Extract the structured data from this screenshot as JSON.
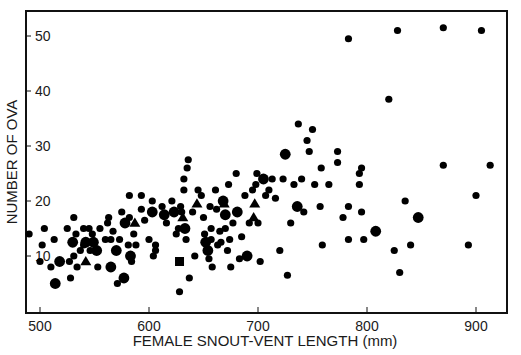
{
  "chart_data": {
    "type": "scatter",
    "title": "",
    "xlabel": "FEMALE SNOUT-VENT LENGTH (mm)",
    "ylabel": "NUMBER OF OVA",
    "xlim": [
      487,
      928
    ],
    "ylim": [
      0,
      56
    ],
    "xticks": [
      500,
      600,
      700,
      800,
      900
    ],
    "yticks": [
      10,
      20,
      30,
      40,
      50
    ],
    "grid": false,
    "legend": null,
    "marker_color": "#000000",
    "marker_shapes": [
      "circle",
      "triangle",
      "square"
    ],
    "marker_sizes_note": "small / medium / large circles denote overlapping records",
    "points": [
      [
        490,
        14,
        "s",
        "c"
      ],
      [
        500,
        9,
        "s",
        "c"
      ],
      [
        502,
        12,
        "s",
        "c"
      ],
      [
        504,
        15,
        "s",
        "c"
      ],
      [
        510,
        8,
        "s",
        "c"
      ],
      [
        513,
        13,
        "s",
        "c"
      ],
      [
        514,
        5,
        "m",
        "c"
      ],
      [
        518,
        9,
        "m",
        "c"
      ],
      [
        525,
        15,
        "s",
        "c"
      ],
      [
        527,
        9,
        "s",
        "c"
      ],
      [
        528,
        6,
        "s",
        "c"
      ],
      [
        530,
        12.5,
        "m",
        "c"
      ],
      [
        531,
        17,
        "s",
        "c"
      ],
      [
        531,
        10,
        "s",
        "c"
      ],
      [
        533,
        14,
        "s",
        "c"
      ],
      [
        534,
        8,
        "s",
        "c"
      ],
      [
        537,
        11,
        "s",
        "c"
      ],
      [
        540,
        15,
        "s",
        "c"
      ],
      [
        540,
        12,
        "s",
        "c"
      ],
      [
        542,
        12.5,
        "m",
        "c"
      ],
      [
        542,
        9,
        "s",
        "t"
      ],
      [
        545,
        15,
        "s",
        "c"
      ],
      [
        546,
        11,
        "s",
        "c"
      ],
      [
        548,
        14,
        "s",
        "c"
      ],
      [
        549,
        12.5,
        "m",
        "c"
      ],
      [
        552,
        11,
        "m",
        "c"
      ],
      [
        553,
        8,
        "s",
        "c"
      ],
      [
        555,
        15,
        "s",
        "c"
      ],
      [
        560,
        13,
        "s",
        "c"
      ],
      [
        562,
        16,
        "s",
        "c"
      ],
      [
        563,
        17,
        "s",
        "c"
      ],
      [
        565,
        8,
        "m",
        "c"
      ],
      [
        565,
        13,
        "s",
        "c"
      ],
      [
        567,
        14.5,
        "s",
        "c"
      ],
      [
        570,
        11,
        "m",
        "c"
      ],
      [
        571,
        5,
        "s",
        "c"
      ],
      [
        573,
        13,
        "s",
        "c"
      ],
      [
        575,
        18,
        "s",
        "c"
      ],
      [
        577,
        6,
        "m",
        "c"
      ],
      [
        578,
        16,
        "m",
        "c"
      ],
      [
        581,
        12,
        "s",
        "c"
      ],
      [
        582,
        17,
        "s",
        "c"
      ],
      [
        582,
        21,
        "s",
        "c"
      ],
      [
        583,
        10,
        "m",
        "c"
      ],
      [
        584,
        9,
        "s",
        "c"
      ],
      [
        586,
        14,
        "s",
        "c"
      ],
      [
        587,
        16,
        "s",
        "t"
      ],
      [
        588,
        12,
        "s",
        "c"
      ],
      [
        593,
        21,
        "s",
        "c"
      ],
      [
        593,
        18.5,
        "s",
        "c"
      ],
      [
        596,
        16.5,
        "s",
        "c"
      ],
      [
        600,
        13,
        "s",
        "c"
      ],
      [
        603,
        20,
        "s",
        "c"
      ],
      [
        603,
        18,
        "m",
        "c"
      ],
      [
        604,
        10,
        "s",
        "c"
      ],
      [
        606,
        11,
        "s",
        "c"
      ],
      [
        606,
        12,
        "s",
        "c"
      ],
      [
        612,
        19,
        "s",
        "c"
      ],
      [
        614,
        17.5,
        "m",
        "c"
      ],
      [
        616,
        16,
        "s",
        "c"
      ],
      [
        621,
        20,
        "s",
        "c"
      ],
      [
        623,
        18,
        "m",
        "c"
      ],
      [
        625,
        14,
        "s",
        "c"
      ],
      [
        627,
        15,
        "s",
        "c"
      ],
      [
        628,
        9,
        "m",
        "q"
      ],
      [
        628,
        3.5,
        "s",
        "c"
      ],
      [
        629,
        19,
        "s",
        "c"
      ],
      [
        630,
        18,
        "s",
        "c"
      ],
      [
        631,
        17,
        "s",
        "t"
      ],
      [
        632,
        22,
        "s",
        "c"
      ],
      [
        632,
        24,
        "s",
        "c"
      ],
      [
        633,
        15,
        "m",
        "c"
      ],
      [
        634,
        13,
        "s",
        "c"
      ],
      [
        635,
        26,
        "s",
        "c"
      ],
      [
        636,
        27.5,
        "s",
        "c"
      ],
      [
        637,
        6,
        "s",
        "c"
      ],
      [
        640,
        18,
        "s",
        "c"
      ],
      [
        642,
        10,
        "s",
        "c"
      ],
      [
        644,
        19.5,
        "s",
        "t"
      ],
      [
        645,
        22,
        "s",
        "c"
      ],
      [
        648,
        21,
        "s",
        "c"
      ],
      [
        650,
        17,
        "s",
        "c"
      ],
      [
        651,
        14,
        "s",
        "c"
      ],
      [
        652,
        12.5,
        "m",
        "c"
      ],
      [
        654,
        11,
        "m",
        "c"
      ],
      [
        655,
        9.5,
        "s",
        "c"
      ],
      [
        656,
        19,
        "s",
        "c"
      ],
      [
        657,
        15,
        "s",
        "c"
      ],
      [
        657,
        13,
        "s",
        "c"
      ],
      [
        658,
        8,
        "s",
        "c"
      ],
      [
        661,
        22,
        "s",
        "c"
      ],
      [
        662,
        18.5,
        "s",
        "c"
      ],
      [
        663,
        12,
        "s",
        "c"
      ],
      [
        665,
        14.5,
        "s",
        "c"
      ],
      [
        666,
        12.5,
        "s",
        "c"
      ],
      [
        668,
        20,
        "m",
        "c"
      ],
      [
        669,
        19.5,
        "s",
        "t"
      ],
      [
        670,
        17.5,
        "m",
        "c"
      ],
      [
        670,
        15,
        "s",
        "c"
      ],
      [
        672,
        11,
        "s",
        "c"
      ],
      [
        673,
        23,
        "s",
        "c"
      ],
      [
        674,
        13,
        "s",
        "c"
      ],
      [
        675,
        8,
        "s",
        "c"
      ],
      [
        677,
        16,
        "s",
        "c"
      ],
      [
        680,
        25,
        "s",
        "c"
      ],
      [
        681,
        18,
        "m",
        "c"
      ],
      [
        683,
        9.5,
        "s",
        "c"
      ],
      [
        685,
        13.5,
        "s",
        "c"
      ],
      [
        688,
        21,
        "s",
        "c"
      ],
      [
        690,
        10,
        "m",
        "c"
      ],
      [
        692,
        16,
        "s",
        "c"
      ],
      [
        695,
        22,
        "s",
        "c"
      ],
      [
        696,
        17,
        "s",
        "t"
      ],
      [
        697,
        19.5,
        "s",
        "t"
      ],
      [
        698,
        23,
        "s",
        "c"
      ],
      [
        699,
        25,
        "s",
        "c"
      ],
      [
        700,
        16,
        "s",
        "c"
      ],
      [
        702,
        9,
        "s",
        "c"
      ],
      [
        705,
        24,
        "m",
        "c"
      ],
      [
        707,
        21,
        "s",
        "c"
      ],
      [
        710,
        22,
        "s",
        "c"
      ],
      [
        713,
        24,
        "s",
        "c"
      ],
      [
        716,
        20.5,
        "s",
        "c"
      ],
      [
        720,
        11,
        "s",
        "c"
      ],
      [
        723,
        24,
        "s",
        "c"
      ],
      [
        725,
        28.5,
        "m",
        "c"
      ],
      [
        727,
        6.5,
        "s",
        "c"
      ],
      [
        730,
        16,
        "s",
        "c"
      ],
      [
        733,
        23,
        "s",
        "c"
      ],
      [
        736,
        19,
        "m",
        "c"
      ],
      [
        737,
        34,
        "s",
        "c"
      ],
      [
        740,
        24,
        "s",
        "c"
      ],
      [
        742,
        18,
        "s",
        "c"
      ],
      [
        745,
        31,
        "s",
        "c"
      ],
      [
        747,
        29,
        "s",
        "c"
      ],
      [
        750,
        33,
        "s",
        "c"
      ],
      [
        752,
        23,
        "s",
        "c"
      ],
      [
        757,
        19,
        "s",
        "c"
      ],
      [
        758,
        26,
        "s",
        "c"
      ],
      [
        759,
        12,
        "s",
        "c"
      ],
      [
        765,
        23,
        "s",
        "c"
      ],
      [
        773,
        27,
        "s",
        "c"
      ],
      [
        773,
        29,
        "s",
        "c"
      ],
      [
        778,
        17,
        "s",
        "c"
      ],
      [
        783,
        49.5,
        "s",
        "c"
      ],
      [
        783,
        13,
        "s",
        "c"
      ],
      [
        783,
        19,
        "s",
        "c"
      ],
      [
        793,
        25,
        "s",
        "c"
      ],
      [
        793,
        23,
        "s",
        "c"
      ],
      [
        795,
        26,
        "s",
        "c"
      ],
      [
        795,
        18,
        "s",
        "c"
      ],
      [
        797,
        13,
        "s",
        "c"
      ],
      [
        808,
        14.5,
        "m",
        "c"
      ],
      [
        820,
        38.5,
        "s",
        "c"
      ],
      [
        825,
        11,
        "s",
        "c"
      ],
      [
        828,
        51,
        "s",
        "c"
      ],
      [
        830,
        7,
        "s",
        "c"
      ],
      [
        835,
        20,
        "s",
        "c"
      ],
      [
        840,
        12,
        "s",
        "c"
      ],
      [
        847,
        17,
        "m",
        "c"
      ],
      [
        870,
        51.5,
        "s",
        "c"
      ],
      [
        870,
        26.5,
        "s",
        "c"
      ],
      [
        893,
        12,
        "s",
        "c"
      ],
      [
        900,
        21,
        "s",
        "c"
      ],
      [
        905,
        51,
        "s",
        "c"
      ],
      [
        913,
        26.5,
        "s",
        "c"
      ]
    ]
  },
  "axes": {
    "x_title": "FEMALE SNOUT-VENT LENGTH (mm)",
    "y_title": "NUMBER OF OVA",
    "x_tick_labels": [
      "500",
      "600",
      "700",
      "800",
      "900"
    ],
    "y_tick_labels": [
      "10",
      "20",
      "30",
      "40",
      "50"
    ]
  }
}
